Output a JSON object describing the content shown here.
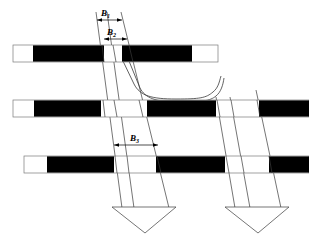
{
  "figure": {
    "background_color": "#ffffff",
    "line_color": "#3a3a3a",
    "fill_black": "#000000",
    "fill_white": "#ffffff",
    "width": 309,
    "height": 243
  },
  "labels": {
    "b1": {
      "letter": "B",
      "sub": "1"
    },
    "b2": {
      "letter": "B",
      "sub": "2"
    },
    "b3": {
      "letter": "B",
      "sub": "3"
    }
  },
  "bars": [
    {
      "name": "top-bar",
      "x": 13,
      "y": 45,
      "width": 205,
      "height": 17,
      "segments": [
        {
          "kind": "white",
          "x": 13,
          "width": 20
        },
        {
          "kind": "black",
          "x": 33,
          "width": 71
        },
        {
          "kind": "white",
          "x": 104,
          "width": 18
        },
        {
          "kind": "black",
          "x": 122,
          "width": 70
        },
        {
          "kind": "white",
          "x": 192,
          "width": 26
        }
      ]
    },
    {
      "name": "middle-bar",
      "x": 13,
      "y": 100,
      "width": 296,
      "height": 17,
      "segments": [
        {
          "kind": "white",
          "x": 13,
          "width": 21
        },
        {
          "kind": "black",
          "x": 34,
          "width": 67
        },
        {
          "kind": "white",
          "x": 101,
          "width": 46
        },
        {
          "kind": "black",
          "x": 147,
          "width": 69
        },
        {
          "kind": "white",
          "x": 216,
          "width": 43
        },
        {
          "kind": "black",
          "x": 259,
          "width": 50
        }
      ]
    },
    {
      "name": "bottom-bar",
      "x": 24,
      "y": 156,
      "width": 285,
      "height": 17,
      "segments": [
        {
          "kind": "white",
          "x": 24,
          "width": 23
        },
        {
          "kind": "black",
          "x": 47,
          "width": 67
        },
        {
          "kind": "white",
          "x": 114,
          "width": 42
        },
        {
          "kind": "black",
          "x": 156,
          "width": 69
        },
        {
          "kind": "white",
          "x": 225,
          "width": 44
        },
        {
          "kind": "black",
          "x": 269,
          "width": 40
        }
      ]
    }
  ],
  "bands": [
    {
      "name": "left-band",
      "arrow_label": "downward-arrow"
    },
    {
      "name": "right-band",
      "arrow_label": "downward-arrow"
    }
  ],
  "dimension_lines": [
    {
      "name": "b1-dimension",
      "label_ref": "b1"
    },
    {
      "name": "b2-dimension",
      "label_ref": "b2"
    },
    {
      "name": "b3-dimension",
      "label_ref": "b3"
    }
  ]
}
